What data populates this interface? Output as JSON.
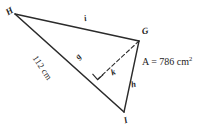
{
  "figure": {
    "type": "geometry-diagram",
    "shape": "triangle",
    "stroke_color": "#2b2b2b",
    "background_color": "#ffffff"
  },
  "vertices": [
    {
      "name": "H",
      "label": "H",
      "x": 15,
      "y": 14
    },
    {
      "name": "G",
      "label": "G",
      "x": 139,
      "y": 41
    },
    {
      "name": "I",
      "label": "I",
      "x": 124,
      "y": 112
    }
  ],
  "sides": [
    {
      "name": "HG",
      "label": "i",
      "style": "solid"
    },
    {
      "name": "HI",
      "label": "g",
      "style": "solid"
    },
    {
      "name": "GI",
      "label": "h",
      "style": "solid"
    }
  ],
  "altitude": {
    "label": "k",
    "from": "G",
    "foot_x": 98,
    "foot_y": 79,
    "style": "dashed",
    "right_angle_marked": true
  },
  "measurements": {
    "base_length": "112 cm",
    "area_text": "A = 786 cm",
    "area_prefix": "A =",
    "area_value": "786",
    "area_unit": "cm",
    "area_exponent": "2"
  }
}
